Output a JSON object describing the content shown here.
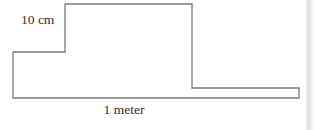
{
  "figure": {
    "background_color": "#ffffff",
    "stroke_color": "#7a7a7a",
    "stroke_width": 1.3,
    "text_color": "#333333",
    "labels": {
      "height": "10 cm",
      "width": "1 meter"
    },
    "shape": {
      "type": "polygon",
      "closed": true,
      "points": [
        [
          13,
          52
        ],
        [
          65,
          52
        ],
        [
          65,
          4
        ],
        [
          192,
          4
        ],
        [
          192,
          88
        ],
        [
          299,
          88
        ],
        [
          299,
          98
        ],
        [
          13,
          98
        ]
      ]
    },
    "artifact": {
      "name": "scan-edge-band",
      "color": "#d8d8d8"
    }
  }
}
